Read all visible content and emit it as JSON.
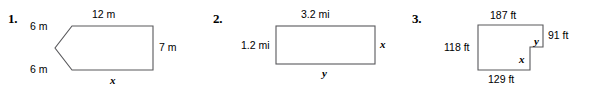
{
  "page": {
    "background_color": "#ffffff",
    "stroke_color": "#58585b"
  },
  "problems": [
    {
      "number": "1.",
      "shape": "pentagon-arrow",
      "unit": "m",
      "labels": {
        "top": "12 m",
        "upper_left": "6 m",
        "lower_left": "6 m",
        "right": "7 m",
        "bottom": "x"
      }
    },
    {
      "number": "2.",
      "shape": "rectangle",
      "unit": "mi",
      "labels": {
        "top": "3.2 mi",
        "left": "1.2 mi",
        "right": "x",
        "bottom": "y"
      }
    },
    {
      "number": "3.",
      "shape": "l-shape-notched-rectangle",
      "unit": "ft",
      "labels": {
        "top": "187 ft",
        "left": "118 ft",
        "right": "91 ft",
        "bottom": "129 ft",
        "inner_vertical": "y",
        "inner_horizontal": "x"
      }
    }
  ]
}
